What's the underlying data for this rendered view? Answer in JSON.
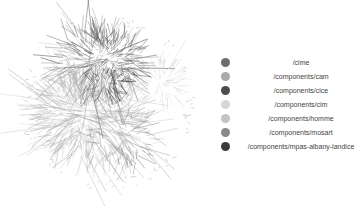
{
  "diagram": {
    "type": "network-graph",
    "layout": "force-directed hairball",
    "clusters": [
      {
        "id": "cime",
        "cx": 98,
        "cy": 62,
        "rx": 42,
        "ry": 32,
        "color": "#6e6e6e",
        "edges": 260,
        "spread": 30
      },
      {
        "id": "cam",
        "cx": 88,
        "cy": 115,
        "rx": 48,
        "ry": 42,
        "color": "#a9a9a9",
        "edges": 420,
        "spread": 40
      },
      {
        "id": "cice",
        "cx": 112,
        "cy": 58,
        "rx": 32,
        "ry": 24,
        "color": "#4d4d4d",
        "edges": 160,
        "spread": 24
      },
      {
        "id": "cim",
        "cx": 160,
        "cy": 82,
        "rx": 22,
        "ry": 20,
        "color": "#d6d6d6",
        "edges": 110,
        "spread": 22
      },
      {
        "id": "homme",
        "cx": 75,
        "cy": 110,
        "rx": 34,
        "ry": 32,
        "color": "#c4c4c4",
        "edges": 180,
        "spread": 28
      },
      {
        "id": "mosart",
        "cx": 125,
        "cy": 135,
        "rx": 30,
        "ry": 30,
        "color": "#8a8a8a",
        "edges": 120,
        "spread": 30
      },
      {
        "id": "mpas",
        "cx": 105,
        "cy": 85,
        "rx": 18,
        "ry": 14,
        "color": "#3b3b3b",
        "edges": 70,
        "spread": 14
      }
    ],
    "ring": {
      "cx": 108,
      "cy": 103,
      "r": 88,
      "dots": 70,
      "color": "#cfcfcf"
    }
  },
  "legend": {
    "items": [
      {
        "label": "/cime",
        "color": "#6e6e6e"
      },
      {
        "label": "/components/cam",
        "color": "#a9a9a9"
      },
      {
        "label": "/components/cice",
        "color": "#4d4d4d"
      },
      {
        "label": "/components/cim",
        "color": "#d6d6d6"
      },
      {
        "label": "/components/homme",
        "color": "#c4c4c4"
      },
      {
        "label": "/components/mosart",
        "color": "#8a8a8a"
      },
      {
        "label": "/components/mpas-albany-landice",
        "color": "#3b3b3b"
      }
    ]
  }
}
